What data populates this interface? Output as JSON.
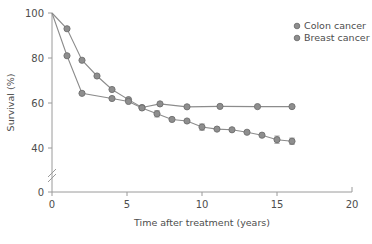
{
  "chart_data": {
    "type": "line",
    "title": "",
    "subtitle": "",
    "xlabel": "Time after treatment (years)",
    "ylabel": "Survival (%)",
    "xlim": [
      0,
      20
    ],
    "ylim": [
      0,
      100
    ],
    "y_axis_break": {
      "present": true,
      "between": [
        0,
        40
      ],
      "symbol": "//"
    },
    "xticks": [
      0,
      5,
      10,
      15,
      20
    ],
    "xtick_labels": [
      "0",
      "5",
      "10",
      "15",
      "20"
    ],
    "yticks": [
      0,
      40,
      60,
      80,
      100
    ],
    "ytick_labels": [
      "0",
      "40",
      "60",
      "80",
      "100"
    ],
    "grid": false,
    "legend_position": "top-right",
    "marker": "circle",
    "colors": {
      "colon": "#8e8e8e",
      "breast": "#8e8e8e",
      "axis": "#9a9a9a",
      "text": "#4d4d4d"
    },
    "series": [
      {
        "name": "Colon cancer",
        "x": [
          0,
          1,
          2,
          3,
          4,
          5.1,
          6,
          7.2,
          9,
          11.2,
          13.7,
          16
        ],
        "values": [
          100,
          93,
          79,
          72,
          66,
          61.5,
          58,
          59.6,
          58.3,
          58.5,
          58.4,
          58.4
        ],
        "errors": [
          0,
          0,
          0,
          0,
          0,
          0,
          0,
          0,
          0,
          0,
          0,
          0
        ]
      },
      {
        "name": "Breast cancer",
        "x": [
          0,
          1,
          2,
          4,
          5.1,
          6,
          7,
          8,
          9,
          10,
          11,
          12,
          13,
          14,
          15,
          16
        ],
        "values": [
          100,
          81,
          64.3,
          62,
          60.7,
          57.8,
          55.2,
          52.7,
          52,
          49.3,
          48.4,
          48.1,
          47,
          45.7,
          43.7,
          43
        ],
        "errors": [
          0,
          0,
          0,
          0,
          0,
          0,
          1.4,
          0,
          0,
          1.4,
          0,
          0,
          0,
          0,
          1.6,
          1.4
        ]
      }
    ]
  },
  "legend": {
    "entries": [
      {
        "label": "Colon cancer",
        "marker": "circle-icon"
      },
      {
        "label": "Breast cancer",
        "marker": "circle-icon"
      }
    ]
  }
}
